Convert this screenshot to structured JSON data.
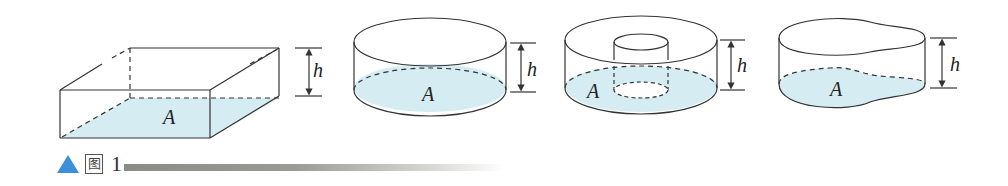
{
  "figure": {
    "caption": {
      "marker": "▲",
      "prefix_glyph": "图",
      "number": "1"
    },
    "panels": [
      {
        "shape": "rectangular-prism",
        "base_label": "A",
        "height_label": "h"
      },
      {
        "shape": "cylinder",
        "base_label": "A",
        "height_label": "h"
      },
      {
        "shape": "annular-cylinder",
        "base_label": "A",
        "height_label": "h"
      },
      {
        "shape": "irregular-cylinder",
        "base_label": "A",
        "height_label": "h"
      }
    ],
    "colors": {
      "fill": "#d5ecf3",
      "stroke": "#333333",
      "marker": "#3d8fdc"
    }
  }
}
